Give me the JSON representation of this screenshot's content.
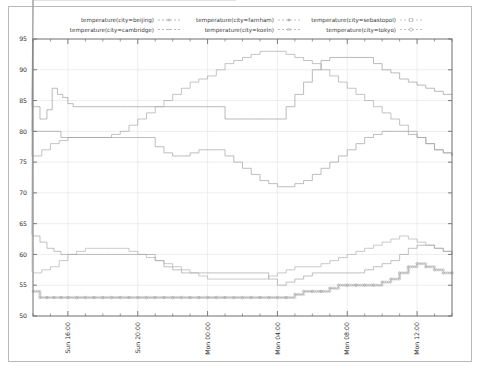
{
  "chart_data": {
    "type": "line",
    "title": "",
    "subtitle": "",
    "xlabel": "",
    "ylabel": "",
    "ylim": [
      50,
      95
    ],
    "yticks": [
      50,
      55,
      60,
      65,
      70,
      75,
      80,
      85,
      90,
      95
    ],
    "ytick_labels": [
      "50",
      "55",
      "60",
      "65",
      "70",
      "75",
      "80",
      "85",
      "90",
      "95"
    ],
    "xlim": [
      0,
      24
    ],
    "xticks": [
      2,
      6,
      10,
      14,
      18,
      22
    ],
    "xtick_labels": [
      "Sun 16:00",
      "Sun 20:00",
      "Mon 00:00",
      "Mon 04:00",
      "Mon 08:00",
      "Mon 12:00"
    ],
    "grid": true,
    "legend_position": "top",
    "legend_columns": 3,
    "line_style": "stepped-dotted",
    "series": [
      {
        "name": "temperature(city=beijing)",
        "color": "#9a9a9a",
        "marker": "plus",
        "x": [
          0.0,
          0.4,
          0.8,
          1.1,
          1.4,
          1.7,
          2.0,
          2.3,
          2.6,
          3.0,
          3.4,
          3.8,
          4.2,
          4.6,
          5.0,
          5.4,
          5.8,
          6.2,
          6.6,
          7.0,
          7.4,
          7.8,
          8.2,
          8.6,
          9.0,
          9.5,
          10.0,
          10.5,
          11.0,
          11.5,
          12.0,
          12.5,
          13.0,
          13.5,
          14.0,
          14.5,
          15.0,
          15.5,
          16.0,
          16.5,
          17.0,
          17.5,
          18.0,
          18.5,
          19.0,
          19.5,
          20.0,
          20.5,
          21.0,
          21.5,
          22.0,
          22.5,
          23.0,
          23.5,
          24.0
        ],
        "values": [
          84.0,
          82.0,
          83.5,
          87.0,
          86.0,
          85.5,
          84.5,
          84.0,
          84.0,
          84.0,
          84.0,
          84.0,
          84.0,
          84.0,
          84.0,
          84.0,
          84.0,
          84.0,
          84.0,
          84.0,
          84.0,
          84.0,
          84.0,
          84.0,
          84.0,
          84.0,
          84.0,
          84.0,
          82.0,
          82.0,
          82.0,
          82.0,
          82.0,
          82.0,
          82.0,
          84.0,
          86.0,
          88.0,
          90.0,
          91.5,
          92.0,
          92.0,
          92.0,
          92.0,
          92.0,
          91.0,
          90.0,
          89.5,
          88.5,
          88.0,
          87.5,
          87.0,
          86.5,
          86.0,
          86.0
        ]
      },
      {
        "name": "temperature(city=farnham)",
        "color": "#a8a8a8",
        "marker": "star",
        "x": [
          0.0,
          0.5,
          1.0,
          1.5,
          2.0,
          2.5,
          3.0,
          3.5,
          4.0,
          4.5,
          5.0,
          5.5,
          6.0,
          6.5,
          7.0,
          7.5,
          8.0,
          8.5,
          9.0,
          9.5,
          10.0,
          10.5,
          11.0,
          11.5,
          12.0,
          12.5,
          13.0,
          13.5,
          14.0,
          14.5,
          15.0,
          15.5,
          16.0,
          16.5,
          17.0,
          17.5,
          18.0,
          18.5,
          19.0,
          19.5,
          20.0,
          20.5,
          21.0,
          21.5,
          22.0,
          22.5,
          23.0,
          23.5,
          24.0
        ],
        "values": [
          76.0,
          77.0,
          78.0,
          78.5,
          79.0,
          79.0,
          79.0,
          79.0,
          79.0,
          79.5,
          80.0,
          81.0,
          82.0,
          83.0,
          84.0,
          85.0,
          86.0,
          87.0,
          88.0,
          88.5,
          89.0,
          90.0,
          91.0,
          91.5,
          92.0,
          92.5,
          93.0,
          93.0,
          93.0,
          92.5,
          92.0,
          91.5,
          91.0,
          90.0,
          89.0,
          88.0,
          87.0,
          86.0,
          85.0,
          84.0,
          83.0,
          82.0,
          81.0,
          80.0,
          79.0,
          78.0,
          77.0,
          76.5,
          76.0
        ]
      },
      {
        "name": "temperature(city=sebastopol)",
        "color": "#b0b0b0",
        "marker": "square",
        "x": [
          0.0,
          0.5,
          1.0,
          1.5,
          2.0,
          2.5,
          3.0,
          3.5,
          4.0,
          4.5,
          5.0,
          5.5,
          6.0,
          6.5,
          7.0,
          7.5,
          8.0,
          8.5,
          9.0,
          9.5,
          10.0,
          10.5,
          11.0,
          11.5,
          12.0,
          12.5,
          13.0,
          13.5,
          14.0,
          14.5,
          15.0,
          15.5,
          16.0,
          16.5,
          17.0,
          17.5,
          18.0,
          18.5,
          19.0,
          19.5,
          20.0,
          20.5,
          21.0,
          21.5,
          22.0,
          22.5,
          23.0,
          23.5,
          24.0
        ],
        "values": [
          57.0,
          57.5,
          58.0,
          59.0,
          60.0,
          60.5,
          61.0,
          61.0,
          61.0,
          61.0,
          61.0,
          60.5,
          60.0,
          59.5,
          59.0,
          58.5,
          58.0,
          57.5,
          57.0,
          56.5,
          56.0,
          56.0,
          56.0,
          56.0,
          56.0,
          56.0,
          56.0,
          56.5,
          57.0,
          57.5,
          58.0,
          58.0,
          58.0,
          58.5,
          59.0,
          59.5,
          60.0,
          60.5,
          61.0,
          61.5,
          62.0,
          62.5,
          63.0,
          62.5,
          62.0,
          61.5,
          61.0,
          60.5,
          60.0
        ]
      },
      {
        "name": "temperature(city=cambridge)",
        "color": "#9f9f9f",
        "marker": "dash",
        "x": [
          0.0,
          0.4,
          0.8,
          1.2,
          1.6,
          2.0,
          2.4,
          2.8,
          3.2,
          3.6,
          4.0,
          4.5,
          5.0,
          5.5,
          6.0,
          6.5,
          7.0,
          7.5,
          8.0,
          8.5,
          9.0,
          9.5,
          10.0,
          10.5,
          11.0,
          11.5,
          12.0,
          12.5,
          13.0,
          13.5,
          14.0,
          14.5,
          15.0,
          15.5,
          16.0,
          16.5,
          17.0,
          17.5,
          18.0,
          18.5,
          19.0,
          19.5,
          20.0,
          20.5,
          21.0,
          21.5,
          22.0,
          22.5,
          23.0,
          23.5,
          24.0
        ],
        "values": [
          80.0,
          80.0,
          80.0,
          80.0,
          79.0,
          79.0,
          79.0,
          79.0,
          79.0,
          79.0,
          79.0,
          79.0,
          79.0,
          79.0,
          79.0,
          79.0,
          77.5,
          76.5,
          76.0,
          76.0,
          76.5,
          77.0,
          77.0,
          77.0,
          76.0,
          75.0,
          74.0,
          73.0,
          72.0,
          71.5,
          71.0,
          71.0,
          71.5,
          72.0,
          73.0,
          74.0,
          75.0,
          76.0,
          77.0,
          78.0,
          79.0,
          79.5,
          80.0,
          80.0,
          80.0,
          79.5,
          79.0,
          78.0,
          77.0,
          76.5,
          76.0
        ]
      },
      {
        "name": "temperature(city=koeln)",
        "color": "#a3a3a3",
        "marker": "cross",
        "x": [
          0.0,
          0.4,
          0.8,
          1.2,
          1.6,
          2.0,
          2.4,
          2.8,
          3.2,
          3.6,
          4.0,
          4.5,
          5.0,
          5.5,
          6.0,
          6.5,
          7.0,
          7.5,
          8.0,
          8.5,
          9.0,
          9.5,
          10.0,
          10.5,
          11.0,
          11.5,
          12.0,
          12.5,
          13.0,
          13.5,
          14.0,
          14.5,
          15.0,
          15.5,
          16.0,
          16.5,
          17.0,
          17.5,
          18.0,
          18.5,
          19.0,
          19.5,
          20.0,
          20.5,
          21.0,
          21.5,
          22.0,
          22.5,
          23.0,
          23.5,
          24.0
        ],
        "values": [
          63.0,
          62.0,
          61.0,
          60.5,
          60.0,
          60.0,
          60.0,
          60.0,
          60.0,
          60.0,
          60.0,
          60.0,
          60.0,
          60.0,
          60.0,
          60.0,
          59.0,
          58.0,
          57.5,
          57.0,
          57.0,
          57.0,
          57.0,
          57.0,
          57.0,
          57.0,
          57.0,
          57.0,
          57.0,
          56.0,
          55.0,
          55.5,
          56.0,
          56.5,
          57.0,
          57.0,
          57.0,
          57.0,
          57.0,
          57.0,
          57.5,
          58.0,
          58.5,
          59.0,
          60.0,
          61.0,
          61.5,
          61.5,
          61.0,
          60.5,
          60.0
        ]
      },
      {
        "name": "temperature(city=tokyo)",
        "color": "#adadad",
        "marker": "circle",
        "x": [
          0.0,
          0.4,
          0.8,
          1.2,
          1.6,
          2.0,
          2.5,
          3.0,
          3.5,
          4.0,
          4.5,
          5.0,
          5.5,
          6.0,
          6.5,
          7.0,
          7.5,
          8.0,
          8.5,
          9.0,
          9.5,
          10.0,
          10.5,
          11.0,
          11.5,
          12.0,
          12.5,
          13.0,
          13.5,
          14.0,
          14.5,
          15.0,
          15.5,
          16.0,
          16.5,
          17.0,
          17.5,
          18.0,
          18.5,
          19.0,
          19.5,
          20.0,
          20.5,
          21.0,
          21.5,
          22.0,
          22.5,
          23.0,
          23.5,
          24.0
        ],
        "values": [
          54.0,
          53.0,
          53.0,
          53.0,
          53.0,
          53.0,
          53.0,
          53.0,
          53.0,
          53.0,
          53.0,
          53.0,
          53.0,
          53.0,
          53.0,
          53.0,
          53.0,
          53.0,
          53.0,
          53.0,
          53.0,
          53.0,
          53.0,
          53.0,
          53.0,
          53.0,
          53.0,
          53.0,
          53.0,
          53.0,
          53.0,
          53.5,
          54.0,
          54.0,
          54.0,
          54.5,
          55.0,
          55.0,
          55.0,
          55.0,
          55.0,
          55.5,
          56.0,
          57.0,
          58.0,
          58.5,
          58.0,
          57.5,
          57.0,
          57.0
        ]
      }
    ]
  },
  "legend": {
    "entries": [
      {
        "label": "temperature(city=beijing)"
      },
      {
        "label": "temperature(city=farnham)"
      },
      {
        "label": "temperature(city=sebastopol)"
      },
      {
        "label": "temperature(city=cambridge)"
      },
      {
        "label": "temperature(city=koeln)"
      },
      {
        "label": "temperature(city=tokyo)"
      }
    ]
  },
  "colors": {
    "background": "#ffffff",
    "plot_border": "#6f6f6f",
    "grid": "#e6e6e6",
    "tick_label": "#2e2e2e",
    "outer_border": "#b9b9b9"
  }
}
